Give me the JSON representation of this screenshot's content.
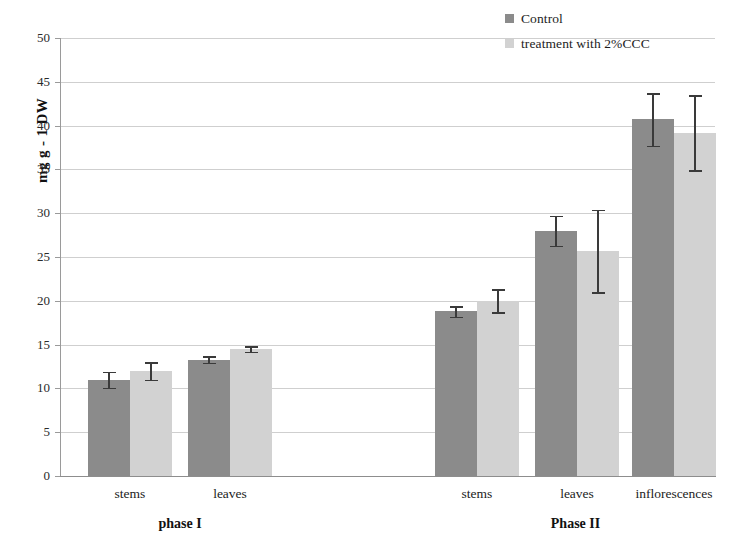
{
  "chart_data": {
    "type": "bar",
    "title": "",
    "xlabel": "",
    "ylabel": "mg g - 1 DW",
    "ylim": [
      0,
      50
    ],
    "ytick_step": 5,
    "ytick_labels": [
      "50",
      "45",
      "40",
      "35",
      "30",
      "25",
      "20",
      "15",
      "10",
      "5",
      "0"
    ],
    "grid": true,
    "legend_position": "top-right",
    "categories": [
      "stems",
      "leaves",
      "stems",
      "leaves",
      "inflorescences"
    ],
    "groups": [
      {
        "label": "phase I",
        "categories": [
          "stems",
          "leaves"
        ]
      },
      {
        "label": "Phase II",
        "categories": [
          "stems",
          "leaves",
          "inflorescences"
        ]
      }
    ],
    "series": [
      {
        "name": "Control",
        "color": "#8b8b8b",
        "values": [
          11.0,
          13.3,
          18.8,
          28.0,
          40.7
        ],
        "errors": [
          0.9,
          0.35,
          0.6,
          1.7,
          3.0
        ]
      },
      {
        "name": "treatment with 2%CCC",
        "color": "#d2d2d2",
        "values": [
          12.0,
          14.5,
          20.0,
          25.7,
          39.2
        ],
        "errors": [
          1.0,
          0.3,
          1.3,
          4.7,
          4.3
        ]
      }
    ]
  },
  "legend": {
    "items": [
      {
        "label": "Control",
        "color": "#8b8b8b"
      },
      {
        "label": "treatment with 2%CCC",
        "color": "#d2d2d2"
      }
    ]
  },
  "axis": {
    "y_title": "mg g - 1 DW"
  }
}
